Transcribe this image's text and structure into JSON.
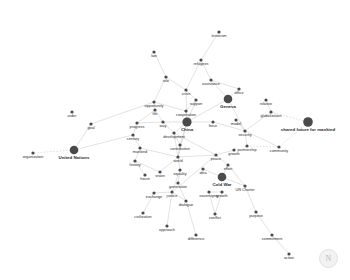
{
  "chart_data": {
    "type": "scatter",
    "title": "",
    "xlabel": "",
    "ylabel": "",
    "layout": "force-directed network graph, light gray edges, dark gray circular nodes, labels below nodes",
    "background_color": "#ffffff",
    "node_color": "#4a4a4a",
    "edge_color": "#c9c9c9",
    "label_color": "#2b2b2b",
    "xlim": [
      0,
      350
    ],
    "ylim": [
      0,
      280
    ],
    "grid": false,
    "legend": "none",
    "nodes": [
      {
        "id": "terrorism",
        "label": "terrorism",
        "x": 219,
        "y": 32,
        "size": 1.6
      },
      {
        "id": "law",
        "label": "law",
        "x": 154,
        "y": 52,
        "size": 1.6
      },
      {
        "id": "refugees",
        "label": "refugees",
        "x": 201,
        "y": 60,
        "size": 1.6
      },
      {
        "id": "role",
        "label": "role",
        "x": 166,
        "y": 77,
        "size": 1.6
      },
      {
        "id": "assistance",
        "label": "assistance",
        "x": 211,
        "y": 80,
        "size": 1.6
      },
      {
        "id": "crisis",
        "label": "crisis",
        "x": 186,
        "y": 90,
        "size": 1.6
      },
      {
        "id": "office",
        "label": "office",
        "x": 239,
        "y": 89,
        "size": 1.6
      },
      {
        "id": "opportunity",
        "label": "opportunity",
        "x": 154,
        "y": 102,
        "size": 1.6
      },
      {
        "id": "support",
        "label": "support",
        "x": 196,
        "y": 100,
        "size": 1.6
      },
      {
        "id": "geneva",
        "label": "Geneva",
        "x": 228,
        "y": 99,
        "size": 4.3
      },
      {
        "id": "relative",
        "label": "relative",
        "x": 266,
        "y": 100,
        "size": 1.6
      },
      {
        "id": "life",
        "label": "life",
        "x": 155,
        "y": 110,
        "size": 1.6
      },
      {
        "id": "cooperation",
        "label": "cooperation",
        "x": 186,
        "y": 111,
        "size": 1.6
      },
      {
        "id": "globalization",
        "label": "globalization",
        "x": 271,
        "y": 112,
        "size": 1.6
      },
      {
        "id": "order",
        "label": "order",
        "x": 72,
        "y": 112,
        "size": 1.6
      },
      {
        "id": "progress",
        "label": "progress",
        "x": 137,
        "y": 123,
        "size": 1.6
      },
      {
        "id": "way",
        "label": "way",
        "x": 163,
        "y": 122,
        "size": 1.6
      },
      {
        "id": "china",
        "label": "China",
        "x": 187,
        "y": 122,
        "size": 4.6
      },
      {
        "id": "force",
        "label": "force",
        "x": 213,
        "y": 122,
        "size": 1.6
      },
      {
        "id": "model",
        "label": "model",
        "x": 236,
        "y": 120,
        "size": 1.6
      },
      {
        "id": "goal",
        "label": "goal",
        "x": 91,
        "y": 124,
        "size": 1.6
      },
      {
        "id": "century",
        "label": "century",
        "x": 133,
        "y": 135,
        "size": 1.6
      },
      {
        "id": "development",
        "label": "development",
        "x": 174,
        "y": 133,
        "size": 1.6
      },
      {
        "id": "security",
        "label": "security",
        "x": 245,
        "y": 131,
        "size": 1.6
      },
      {
        "id": "sharedfuture",
        "label": "shared future for mankind",
        "x": 308,
        "y": 122,
        "size": 4.8
      },
      {
        "id": "mankind",
        "label": "mankind",
        "x": 140,
        "y": 148,
        "size": 1.6
      },
      {
        "id": "contribution",
        "label": "contribution",
        "x": 180,
        "y": 145,
        "size": 1.6
      },
      {
        "id": "partnership",
        "label": "partnership",
        "x": 247,
        "y": 146,
        "size": 1.6
      },
      {
        "id": "community",
        "label": "community",
        "x": 279,
        "y": 147,
        "size": 1.6
      },
      {
        "id": "unitednations",
        "label": "United Nations",
        "x": 74,
        "y": 150,
        "size": 4.3
      },
      {
        "id": "organization",
        "label": "organization",
        "x": 33,
        "y": 153,
        "size": 1.6
      },
      {
        "id": "history",
        "label": "history",
        "x": 135,
        "y": 161,
        "size": 1.6
      },
      {
        "id": "world",
        "label": "world",
        "x": 178,
        "y": 157,
        "size": 1.6
      },
      {
        "id": "peace",
        "label": "peace",
        "x": 216,
        "y": 155,
        "size": 1.6
      },
      {
        "id": "growth",
        "label": "growth",
        "x": 234,
        "y": 150,
        "size": 1.6
      },
      {
        "id": "effort",
        "label": "effort",
        "x": 228,
        "y": 165,
        "size": 1.6
      },
      {
        "id": "vision",
        "label": "vision",
        "x": 160,
        "y": 172,
        "size": 1.6
      },
      {
        "id": "future",
        "label": "future",
        "x": 145,
        "y": 175,
        "size": 1.6
      },
      {
        "id": "equality",
        "label": "equality",
        "x": 180,
        "y": 170,
        "size": 1.6
      },
      {
        "id": "idea",
        "label": "idea",
        "x": 203,
        "y": 169,
        "size": 1.6
      },
      {
        "id": "coldwar",
        "label": "Cold War",
        "x": 222,
        "y": 177,
        "size": 4.3
      },
      {
        "id": "generation",
        "label": "generation",
        "x": 178,
        "y": 183,
        "size": 1.6
      },
      {
        "id": "uncharter",
        "label": "UN Charter",
        "x": 245,
        "y": 186,
        "size": 1.6
      },
      {
        "id": "exchange",
        "label": "exchange",
        "x": 154,
        "y": 193,
        "size": 1.6
      },
      {
        "id": "justice",
        "label": "justice",
        "x": 172,
        "y": 192,
        "size": 1.6
      },
      {
        "id": "sovereignty",
        "label": "sovereignty",
        "x": 209,
        "y": 192,
        "size": 1.6
      },
      {
        "id": "growth2",
        "label": "growth",
        "x": 222,
        "y": 192,
        "size": 1.6
      },
      {
        "id": "dialogue",
        "label": "dialogue",
        "x": 186,
        "y": 201,
        "size": 1.6
      },
      {
        "id": "civilization",
        "label": "civilization",
        "x": 143,
        "y": 213,
        "size": 1.6
      },
      {
        "id": "conflict",
        "label": "conflict",
        "x": 215,
        "y": 214,
        "size": 1.6
      },
      {
        "id": "purpose",
        "label": "purpose",
        "x": 256,
        "y": 212,
        "size": 1.6
      },
      {
        "id": "approach",
        "label": "approach",
        "x": 167,
        "y": 226,
        "size": 1.6
      },
      {
        "id": "difference",
        "label": "difference",
        "x": 196,
        "y": 235,
        "size": 1.6
      },
      {
        "id": "commitment",
        "label": "commitment",
        "x": 272,
        "y": 235,
        "size": 1.6
      },
      {
        "id": "action",
        "label": "action",
        "x": 289,
        "y": 254,
        "size": 1.6
      }
    ],
    "edges": [
      {
        "source": "terrorism",
        "target": "refugees",
        "dashed": false
      },
      {
        "source": "refugees",
        "target": "crisis",
        "dashed": false
      },
      {
        "source": "refugees",
        "target": "assistance",
        "dashed": false
      },
      {
        "source": "law",
        "target": "role",
        "dashed": false
      },
      {
        "source": "role",
        "target": "opportunity",
        "dashed": false
      },
      {
        "source": "role",
        "target": "crisis",
        "dashed": false
      },
      {
        "source": "crisis",
        "target": "support",
        "dashed": false
      },
      {
        "source": "crisis",
        "target": "china",
        "dashed": false
      },
      {
        "source": "assistance",
        "target": "geneva",
        "dashed": false
      },
      {
        "source": "assistance",
        "target": "office",
        "dashed": false
      },
      {
        "source": "office",
        "target": "geneva",
        "dashed": false
      },
      {
        "source": "support",
        "target": "cooperation",
        "dashed": false
      },
      {
        "source": "support",
        "target": "china",
        "dashed": false
      },
      {
        "source": "opportunity",
        "target": "life",
        "dashed": false
      },
      {
        "source": "opportunity",
        "target": "cooperation",
        "dashed": false
      },
      {
        "source": "opportunity",
        "target": "goal",
        "dashed": false
      },
      {
        "source": "life",
        "target": "way",
        "dashed": false
      },
      {
        "source": "life",
        "target": "progress",
        "dashed": false
      },
      {
        "source": "cooperation",
        "target": "china",
        "dashed": false
      },
      {
        "source": "geneva",
        "target": "china",
        "dashed": false
      },
      {
        "source": "geneva",
        "target": "security",
        "dashed": false
      },
      {
        "source": "relative",
        "target": "globalization",
        "dashed": false
      },
      {
        "source": "globalization",
        "target": "security",
        "dashed": false
      },
      {
        "source": "globalization",
        "target": "sharedfuture",
        "dashed": true
      },
      {
        "source": "progress",
        "target": "century",
        "dashed": false
      },
      {
        "source": "progress",
        "target": "way",
        "dashed": false
      },
      {
        "source": "way",
        "target": "china",
        "dashed": false
      },
      {
        "source": "way",
        "target": "development",
        "dashed": false
      },
      {
        "source": "china",
        "target": "force",
        "dashed": false
      },
      {
        "source": "china",
        "target": "development",
        "dashed": false
      },
      {
        "source": "china",
        "target": "contribution",
        "dashed": false
      },
      {
        "source": "china",
        "target": "world",
        "dashed": false
      },
      {
        "source": "force",
        "target": "security",
        "dashed": false
      },
      {
        "source": "model",
        "target": "security",
        "dashed": false
      },
      {
        "source": "security",
        "target": "partnership",
        "dashed": false
      },
      {
        "source": "security",
        "target": "community",
        "dashed": false
      },
      {
        "source": "partnership",
        "target": "community",
        "dashed": true
      },
      {
        "source": "community",
        "target": "sharedfuture",
        "dashed": true
      },
      {
        "source": "development",
        "target": "contribution",
        "dashed": false
      },
      {
        "source": "development",
        "target": "world",
        "dashed": false
      },
      {
        "source": "development",
        "target": "peace",
        "dashed": false
      },
      {
        "source": "century",
        "target": "mankind",
        "dashed": false
      },
      {
        "source": "century",
        "target": "unitednations",
        "dashed": false
      },
      {
        "source": "mankind",
        "target": "history",
        "dashed": false
      },
      {
        "source": "mankind",
        "target": "world",
        "dashed": false
      },
      {
        "source": "goal",
        "target": "unitednations",
        "dashed": false
      },
      {
        "source": "unitednations",
        "target": "organization",
        "dashed": true
      },
      {
        "source": "contribution",
        "target": "world",
        "dashed": false
      },
      {
        "source": "world",
        "target": "equality",
        "dashed": false
      },
      {
        "source": "world",
        "target": "peace",
        "dashed": false
      },
      {
        "source": "world",
        "target": "vision",
        "dashed": false
      },
      {
        "source": "history",
        "target": "future",
        "dashed": false
      },
      {
        "source": "history",
        "target": "vision",
        "dashed": false
      },
      {
        "source": "peace",
        "target": "growth",
        "dashed": false
      },
      {
        "source": "peace",
        "target": "effort",
        "dashed": false
      },
      {
        "source": "peace",
        "target": "justice",
        "dashed": false
      },
      {
        "source": "effort",
        "target": "coldwar",
        "dashed": false
      },
      {
        "source": "effort",
        "target": "uncharter",
        "dashed": false
      },
      {
        "source": "idea",
        "target": "coldwar",
        "dashed": false
      },
      {
        "source": "equality",
        "target": "generation",
        "dashed": false
      },
      {
        "source": "equality",
        "target": "justice",
        "dashed": false
      },
      {
        "source": "generation",
        "target": "dialogue",
        "dashed": false
      },
      {
        "source": "exchange",
        "target": "justice",
        "dashed": false
      },
      {
        "source": "exchange",
        "target": "civilization",
        "dashed": false
      },
      {
        "source": "justice",
        "target": "dialogue",
        "dashed": false
      },
      {
        "source": "justice",
        "target": "approach",
        "dashed": false
      },
      {
        "source": "sovereignty",
        "target": "growth2",
        "dashed": false
      },
      {
        "source": "sovereignty",
        "target": "conflict",
        "dashed": false
      },
      {
        "source": "growth2",
        "target": "conflict",
        "dashed": false
      },
      {
        "source": "dialogue",
        "target": "difference",
        "dashed": false
      },
      {
        "source": "uncharter",
        "target": "purpose",
        "dashed": false
      },
      {
        "source": "purpose",
        "target": "commitment",
        "dashed": false
      },
      {
        "source": "commitment",
        "target": "action",
        "dashed": false
      },
      {
        "source": "coldwar",
        "target": "uncharter",
        "dashed": false
      }
    ]
  },
  "watermark": {
    "symbol": "N"
  }
}
